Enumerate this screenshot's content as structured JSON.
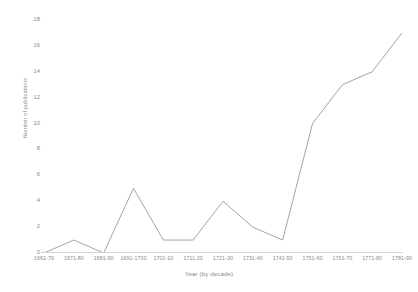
{
  "chart_data": {
    "type": "line",
    "title": "",
    "xlabel": "Year (by decade)",
    "ylabel": "Number of publications",
    "categories": [
      "1661-70",
      "1671-80",
      "1681-90",
      "1691-1700",
      "1701-10",
      "1711-20",
      "1721-30",
      "1731-40",
      "1741-50",
      "1751-60",
      "1761-70",
      "1771-80",
      "1781-90"
    ],
    "values": [
      0,
      1,
      0,
      5,
      1,
      1,
      4,
      2,
      1,
      10,
      13,
      14,
      17
    ],
    "ylim": [
      0,
      18
    ],
    "yticks": [
      0,
      2,
      4,
      6,
      8,
      10,
      12,
      14,
      16,
      18
    ],
    "ytick_labels": [
      "0",
      "2",
      "4",
      "6",
      "8",
      "10",
      "12",
      "14",
      "16",
      "18"
    ],
    "grid": false,
    "legend": null,
    "series_color": "#9a9a9a",
    "axis_color": "#d6d6d6",
    "text_color": "#8a8a8a",
    "background": "#ffffff"
  }
}
